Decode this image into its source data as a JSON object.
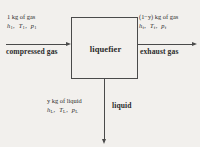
{
  "diagram": {
    "title": "liquefier",
    "background_color": "#f2f0ed",
    "line_color": "#4a4a4a",
    "process_box": {
      "label": "liquefier"
    },
    "streams": [
      {
        "id": "inlet",
        "name": "compressed gas",
        "quantity": "1 kg of gas",
        "enthalpy": "h",
        "enthalpy_subscript": "1",
        "temperature": "T",
        "temperature_subscript": "1",
        "pressure": "p",
        "pressure_subscript": "1",
        "direction": "right"
      },
      {
        "id": "outlet",
        "name": "exhaust gas",
        "quantity": "(1−y) kg of gas",
        "enthalpy": "h",
        "enthalpy_subscript": "f",
        "temperature": "T",
        "temperature_subscript": "f",
        "pressure": "p",
        "pressure_subscript": "f",
        "direction": "right"
      },
      {
        "id": "liquid",
        "name": "liquid",
        "quantity": "y kg of liquid",
        "enthalpy": "h",
        "enthalpy_subscript": "L",
        "temperature": "T",
        "temperature_subscript": "L",
        "pressure": "p",
        "pressure_subscript": "L",
        "direction": "down"
      }
    ]
  }
}
